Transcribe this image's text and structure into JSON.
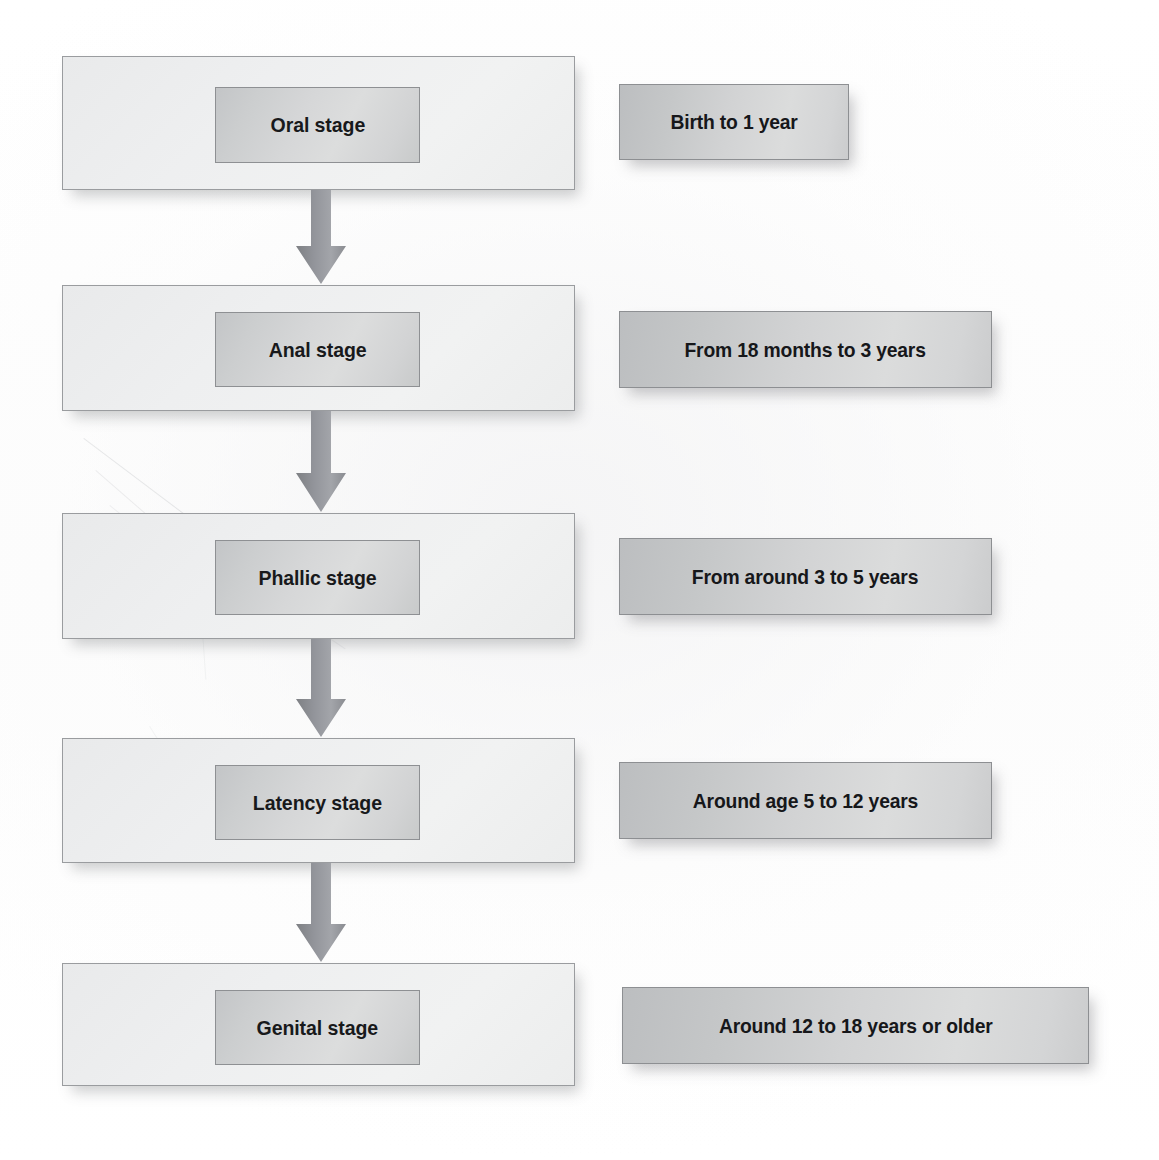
{
  "diagram": {
    "type": "vertical-flowchart",
    "orientation": "top-to-bottom",
    "connector": "down-arrow",
    "colors": {
      "page_background": "#ffffff",
      "panel_fill": "#eeeff0",
      "panel_border": "#9a9c9f",
      "chip_fill": "#d4d5d6",
      "chip_border": "#8e9093",
      "label_fill": "#cccdce",
      "label_border": "#8d8f92",
      "arrow_fill": "#8e9094",
      "text": "#18191b"
    },
    "stages": [
      {
        "stage": "Oral stage",
        "age": "Birth to 1 year"
      },
      {
        "stage": "Anal stage",
        "age": "From 18 months to 3 years"
      },
      {
        "stage": "Phallic stage",
        "age": "From around 3 to 5 years"
      },
      {
        "stage": "Latency stage",
        "age": "Around age 5 to 12 years"
      },
      {
        "stage": "Genital stage",
        "age": "Around 12 to 18 years or older"
      }
    ],
    "arrows": [
      {
        "from": "Oral stage",
        "to": "Anal stage"
      },
      {
        "from": "Anal stage",
        "to": "Phallic stage"
      },
      {
        "from": "Phallic stage",
        "to": "Latency stage"
      },
      {
        "from": "Latency stage",
        "to": "Genital stage"
      }
    ]
  }
}
